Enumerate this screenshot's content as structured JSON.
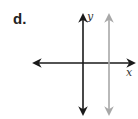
{
  "problem": {
    "label": "d."
  },
  "graph": {
    "x_axis_label": "x",
    "y_axis_label": "y",
    "colors": {
      "axes": "#1a1a1a",
      "vertical_line": "#a8a8a8"
    },
    "elements": [
      {
        "type": "axis",
        "name": "x-axis",
        "orientation": "horizontal",
        "arrows": "both"
      },
      {
        "type": "axis",
        "name": "y-axis",
        "orientation": "vertical",
        "arrows": "both"
      },
      {
        "type": "line",
        "name": "vertical-line",
        "orientation": "vertical",
        "position": "right of y-axis",
        "arrows": "both"
      }
    ]
  }
}
